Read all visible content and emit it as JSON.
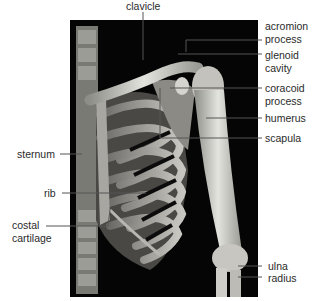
{
  "figure": {
    "background_color": "#ffffff",
    "panel_color": "#050505",
    "bone_color": "#d9d9d4",
    "leader_color": "#555555"
  },
  "labels": {
    "clavicle": "clavicle",
    "acromion_1": "acromion",
    "acromion_2": "process",
    "glenoid_1": "glenoid",
    "glenoid_2": "cavity",
    "coracoid_1": "coracoid",
    "coracoid_2": "process",
    "humerus": "humerus",
    "scapula": "scapula",
    "sternum": "sternum",
    "rib": "rib",
    "costal_1": "costal",
    "costal_2": "cartilage",
    "ulna": "ulna",
    "radius": "radius"
  }
}
